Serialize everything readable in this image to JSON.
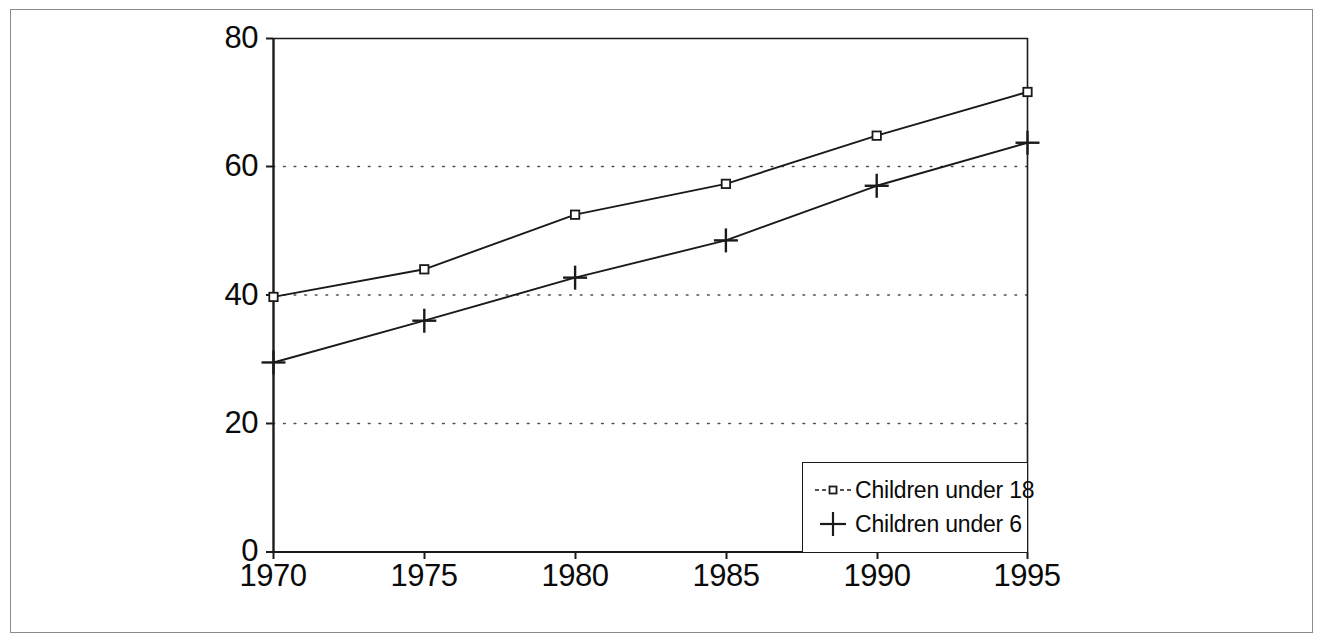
{
  "chart_data": {
    "type": "line",
    "title": "",
    "subtitle": "",
    "xlabel": "",
    "ylabel": "",
    "x": [
      1970,
      1975,
      1980,
      1985,
      1990,
      1995
    ],
    "categories": [
      "1970",
      "1975",
      "1980",
      "1985",
      "1990",
      "1995"
    ],
    "xlim": [
      1970,
      1995
    ],
    "ylim": [
      0,
      80
    ],
    "y_ticks": [
      0,
      20,
      40,
      60,
      80
    ],
    "y_tick_labels": [
      "0",
      "20",
      "40",
      "60",
      "80"
    ],
    "x_tick_labels": [
      "1970",
      "1975",
      "1980",
      "1985",
      "1990",
      "1995"
    ],
    "gridlines": {
      "horizontal_dotted_at": [
        20,
        40,
        60
      ],
      "vertical": false
    },
    "legend_position": "bottom-right",
    "series": [
      {
        "name": "Children under 18",
        "marker": "open-square",
        "values": [
          39.7,
          44.0,
          52.5,
          57.3,
          64.8,
          71.6
        ]
      },
      {
        "name": "Children under 6",
        "marker": "plus",
        "values": [
          29.5,
          36.0,
          42.7,
          48.5,
          57.0,
          63.7
        ]
      }
    ]
  },
  "axes": {
    "y_labels": [
      "80",
      "60",
      "40",
      "20",
      "0"
    ],
    "x_labels": [
      "1970",
      "1975",
      "1980",
      "1985",
      "1990",
      "1995"
    ]
  },
  "legend": {
    "items": [
      {
        "label": "Children under 18",
        "marker": "open-square-line-marker"
      },
      {
        "label": "Children under 6",
        "marker": "plus-marker"
      }
    ]
  },
  "colors": {
    "line": "#1a1a1a",
    "grid": "#555555",
    "axis": "#1a1a1a",
    "frame": "#8a8a8a",
    "background": "#ffffff"
  }
}
